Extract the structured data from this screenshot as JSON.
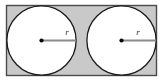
{
  "figure": {
    "canvas": {
      "width": 162,
      "height": 81,
      "background": "#ffffff"
    },
    "rectangle": {
      "name": "bounding-rectangle",
      "x": 6.5,
      "y": 5.5,
      "width": 150,
      "height": 70,
      "fill": "#c9c9c9",
      "stroke": "#4a4a4a",
      "stroke_width": 1.4
    },
    "circles": [
      {
        "name": "left-circle",
        "cx": 41.5,
        "cy": 40.5,
        "r": 34.6,
        "fill": "#ffffff",
        "stroke": "#1a1a1a",
        "stroke_width": 1.3
      },
      {
        "name": "right-circle",
        "cx": 121.5,
        "cy": 40.5,
        "r": 34.6,
        "fill": "#ffffff",
        "stroke": "#1a1a1a",
        "stroke_width": 1.3
      }
    ],
    "radii": [
      {
        "name": "left-radius",
        "x1": 41.5,
        "y1": 40.5,
        "x2": 76.1,
        "y2": 40.5,
        "stroke": "#8a8a8a",
        "stroke_width": 1.8,
        "dot": {
          "cx": 41.5,
          "cy": 40.5,
          "r": 2.1,
          "fill": "#000000"
        },
        "label": "r",
        "label_x": 67,
        "label_y": 35
      },
      {
        "name": "right-radius",
        "x1": 121.5,
        "y1": 40.5,
        "x2": 156.1,
        "y2": 40.5,
        "stroke": "#8a8a8a",
        "stroke_width": 1.8,
        "dot": {
          "cx": 121.5,
          "cy": 40.5,
          "r": 2.1,
          "fill": "#000000"
        },
        "label": "r",
        "label_x": 138,
        "label_y": 35
      }
    ]
  }
}
